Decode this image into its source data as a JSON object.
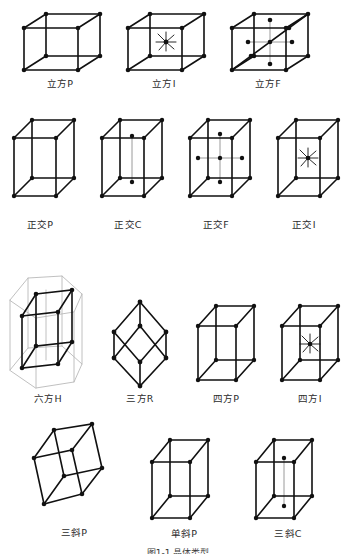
{
  "figure": {
    "caption": "图 1-1  晶体structure",
    "caption_visible_fragment": "图1-1  晶体类型",
    "background": "#ffffff",
    "ink": "#111111",
    "ghost_color": "#b9b9b9"
  },
  "rows": [
    {
      "row_index": 1,
      "cells": [
        {
          "label": "立方P",
          "system": "cubic",
          "centering": "P",
          "label_x": 60,
          "label_y": 84
        },
        {
          "label": "立方I",
          "system": "cubic",
          "centering": "I",
          "label_x": 164,
          "label_y": 84
        },
        {
          "label": "立方F",
          "system": "cubic",
          "centering": "F",
          "label_x": 268,
          "label_y": 84
        }
      ]
    },
    {
      "row_index": 2,
      "cells": [
        {
          "label": "正交P",
          "system": "orthorhombic",
          "centering": "P",
          "label_x": 38,
          "label_y": 224
        },
        {
          "label": "正交C",
          "system": "orthorhombic",
          "centering": "C",
          "label_x": 124,
          "label_y": 224
        },
        {
          "label": "正交F",
          "system": "orthorhombic",
          "centering": "F",
          "label_x": 212,
          "label_y": 224
        },
        {
          "label": "正交I",
          "system": "orthorhombic",
          "centering": "I",
          "label_x": 298,
          "label_y": 224
        }
      ]
    },
    {
      "row_index": 3,
      "cells": [
        {
          "label": "六方H",
          "system": "hexagonal",
          "centering": "H",
          "label_x": 48,
          "label_y": 398
        },
        {
          "label": "三方R",
          "system": "trigonal",
          "centering": "R",
          "label_x": 140,
          "label_y": 398
        },
        {
          "label": "四方P",
          "system": "tetragonal",
          "centering": "P",
          "label_x": 222,
          "label_y": 398
        },
        {
          "label": "四方I",
          "system": "tetragonal",
          "centering": "I",
          "label_x": 304,
          "label_y": 398
        }
      ]
    },
    {
      "row_index": 4,
      "cells": [
        {
          "label": "三斜P",
          "system": "triclinic",
          "centering": "P",
          "label_x": 70,
          "label_y": 531
        },
        {
          "label": "单斜P",
          "system": "monoclinic",
          "centering": "P",
          "label_x": 182,
          "label_y": 533
        },
        {
          "label": "三斜C",
          "system": "triclinic",
          "centering": "C",
          "label_x": 286,
          "label_y": 533
        }
      ]
    }
  ],
  "legend_notes": {
    "node_meaning": "lattice point",
    "star_meaning": "body-centre lattice point with radiating guide lines",
    "ghost_meaning": "hexagonal prism drawn in light grey behind the unit cell"
  }
}
